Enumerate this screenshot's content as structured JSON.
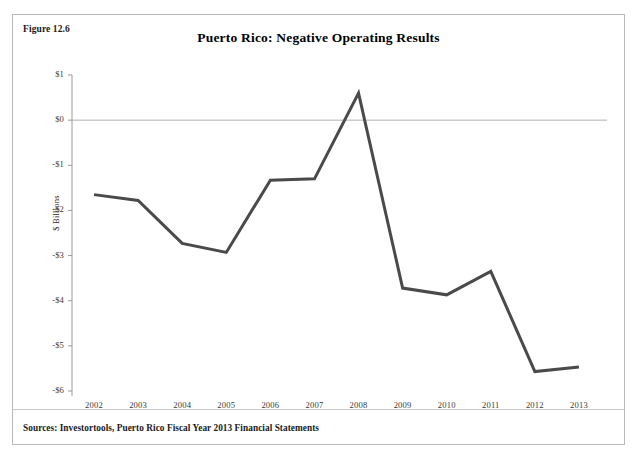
{
  "figure": {
    "number_label": "Figure 12.6",
    "source_note": "Sources: Investortools, Puerto Rico Fiscal Year 2013 Financial Statements"
  },
  "colors": {
    "series_line": "#4a4a4a",
    "zero_line": "#b0b0b0",
    "axis": "#9a9a9a",
    "frame": "#b9b9b9",
    "text": "#1a1a1a"
  },
  "chart_data": {
    "type": "line",
    "title": "Puerto Rico: Negative Operating Results",
    "xlabel": "",
    "ylabel": "$ Billions",
    "categories": [
      "2002",
      "2003",
      "2004",
      "2005",
      "2006",
      "2007",
      "2008",
      "2009",
      "2010",
      "2011",
      "2012",
      "2013"
    ],
    "series": [
      {
        "name": "Operating Results",
        "values": [
          -1.65,
          -1.78,
          -2.73,
          -2.93,
          -1.33,
          -1.3,
          0.6,
          -3.72,
          -3.87,
          -3.35,
          -5.57,
          -5.47
        ]
      }
    ],
    "ylim": [
      -6,
      1
    ],
    "yticks": [
      1,
      0,
      -1,
      -2,
      -3,
      -4,
      -5,
      -6
    ],
    "ytick_labels": [
      "$1",
      "$0",
      "-$1",
      "-$2",
      "-$3",
      "-$4",
      "-$5",
      "-$6"
    ],
    "grid": false,
    "zero_reference_line": 0,
    "legend": "none"
  }
}
